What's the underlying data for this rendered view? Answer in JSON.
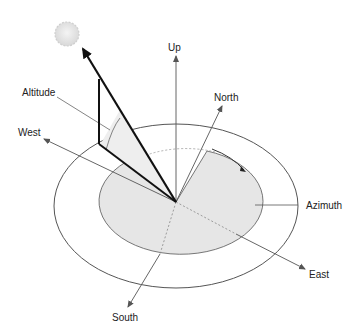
{
  "diagram": {
    "labels": {
      "up": "Up",
      "north": "North",
      "altitude": "Altitude",
      "west": "West",
      "azimuth": "Azimuth",
      "east": "East",
      "south": "South"
    },
    "icons": {
      "sun": "sun-icon"
    },
    "colors": {
      "line": "#555555",
      "sun_ray": "#111111",
      "disc_fill": "#e6e6e6",
      "altitude_fill": "#eeeeee",
      "sun_fill": "#e4e4e4"
    }
  }
}
